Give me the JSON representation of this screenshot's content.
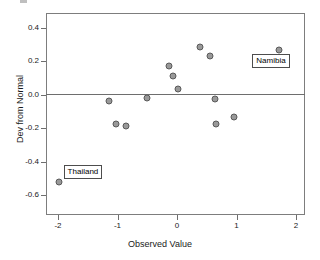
{
  "chart_data": {
    "type": "scatter",
    "title": "",
    "xlabel": "Observed Value",
    "ylabel": "Dev from Normal",
    "xlim": [
      -2.2,
      2.2
    ],
    "ylim": [
      -0.68,
      0.47
    ],
    "grid": false,
    "legend": null,
    "reference_lines": [
      {
        "axis": "y",
        "value": 0.0
      }
    ],
    "xticks": [
      "-2",
      "-1",
      "0",
      "1",
      "2"
    ],
    "xtick_values": [
      -2,
      -1,
      0,
      1,
      2
    ],
    "yticks": [
      "0.4",
      "0.2",
      "0.0",
      "-0.2",
      "-0.4",
      "-0.6"
    ],
    "ytick_values": [
      0.4,
      0.2,
      0.0,
      -0.2,
      -0.4,
      -0.6
    ],
    "marker": {
      "shape": "circle",
      "fill": "#999999",
      "edge": "#595959",
      "size": 7
    },
    "points": [
      {
        "x": -1.99,
        "y": -0.525,
        "label": "Thailand"
      },
      {
        "x": -1.15,
        "y": -0.038,
        "label": ""
      },
      {
        "x": -1.02,
        "y": -0.172,
        "label": ""
      },
      {
        "x": -0.86,
        "y": -0.188,
        "label": ""
      },
      {
        "x": -0.51,
        "y": -0.02,
        "label": ""
      },
      {
        "x": -0.14,
        "y": 0.17,
        "label": ""
      },
      {
        "x": -0.06,
        "y": 0.112,
        "label": ""
      },
      {
        "x": 0.02,
        "y": 0.035,
        "label": ""
      },
      {
        "x": 0.38,
        "y": 0.288,
        "label": ""
      },
      {
        "x": 0.56,
        "y": 0.232,
        "label": ""
      },
      {
        "x": 0.64,
        "y": -0.028,
        "label": ""
      },
      {
        "x": 0.66,
        "y": -0.175,
        "label": ""
      },
      {
        "x": 0.95,
        "y": -0.13,
        "label": ""
      },
      {
        "x": 1.72,
        "y": 0.268,
        "label": "Namibia"
      }
    ],
    "annotations": [
      {
        "text": "Namibia",
        "point_x": 1.72,
        "point_y": 0.268
      },
      {
        "text": "Thailand",
        "point_x": -1.99,
        "point_y": -0.525
      }
    ]
  }
}
